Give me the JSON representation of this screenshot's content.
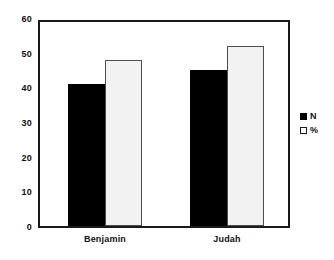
{
  "chart_data": {
    "type": "bar",
    "title": "",
    "subtitle": "",
    "xlabel": "",
    "ylabel": "",
    "categories": [
      "Benjamin",
      "Judah"
    ],
    "series": [
      {
        "name": "N",
        "values": [
          41,
          45
        ],
        "color": "#000000"
      },
      {
        "name": "%",
        "values": [
          48,
          52
        ],
        "color": "#f2f2f2"
      }
    ],
    "ylim": [
      0,
      60
    ],
    "ytick_step": 10,
    "yticks": [
      "60",
      "50",
      "40",
      "30",
      "20",
      "10",
      "0"
    ],
    "ytick_values": [
      60,
      50,
      40,
      30,
      20,
      10,
      0
    ],
    "grid": false,
    "legend_position": "right",
    "frame": true
  },
  "legend": {
    "entries": [
      {
        "label": "N",
        "swatch": "filled-square-icon"
      },
      {
        "label": "%",
        "swatch": "open-square-icon"
      }
    ]
  },
  "axis": {
    "y": {
      "labels": [
        "60",
        "50",
        "40",
        "30",
        "20",
        "10",
        "0"
      ]
    },
    "x": {
      "labels": [
        "Benjamin",
        "Judah"
      ]
    }
  },
  "bars": [
    {
      "group": "Benjamin",
      "series": "N",
      "value": 41
    },
    {
      "group": "Benjamin",
      "series": "%",
      "value": 48
    },
    {
      "group": "Judah",
      "series": "N",
      "value": 45
    },
    {
      "group": "Judah",
      "series": "%",
      "value": 52
    }
  ]
}
